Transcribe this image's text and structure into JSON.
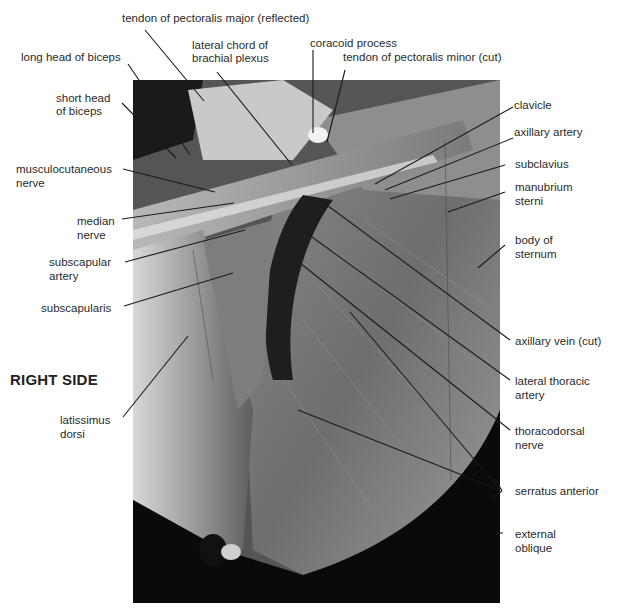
{
  "figure": {
    "side_label": "RIGHT SIDE",
    "photo_description": "dissection photograph of right axilla and lateral thoracic wall",
    "labels": {
      "tendon_pectoralis_major": "tendon of pectoralis major (reflected)",
      "lateral_chord_1": "lateral chord of",
      "lateral_chord_2": "brachial plexus",
      "coracoid_process": "coracoid process",
      "tendon_pectoralis_minor": "tendon of pectoralis minor (cut)",
      "long_head_biceps": "long head of biceps",
      "short_head_1": "short head",
      "short_head_2": "of biceps",
      "musculocutaneous_1": "musculocutaneous",
      "musculocutaneous_2": "nerve",
      "median_1": "median",
      "median_2": "nerve",
      "subscapular_artery_1": "subscapular",
      "subscapular_artery_2": "artery",
      "subscapularis": "subscapularis",
      "latissimus_1": "latissimus",
      "latissimus_2": "dorsi",
      "clavicle": "clavicle",
      "axillary_artery": "axillary artery",
      "subclavius": "subclavius",
      "manubrium_1": "manubrium",
      "manubrium_2": "sterni",
      "body_sternum_1": "body of",
      "body_sternum_2": "sternum",
      "axillary_vein": "axillary vein (cut)",
      "lateral_thoracic_1": "lateral thoracic",
      "lateral_thoracic_2": "artery",
      "thoracodorsal_1": "thoracodorsal",
      "thoracodorsal_2": "nerve",
      "serratus_anterior": "serratus anterior",
      "external_oblique_1": "external",
      "external_oblique_2": "oblique"
    }
  }
}
